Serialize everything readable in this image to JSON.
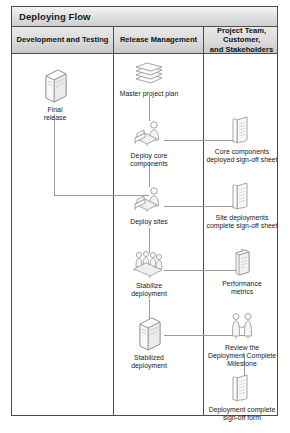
{
  "diagram": {
    "title": "Deploying Flow",
    "type": "cross-functional swimlane flowchart",
    "columns": [
      {
        "id": "development-and-testing",
        "header": "Development and Testing"
      },
      {
        "id": "release-management",
        "header": "Release Management"
      },
      {
        "id": "project-team-customer-and-stakeholders",
        "header": "Project Team, Customer,\nand Stakeholders"
      }
    ],
    "column_headers": {
      "col1": "Development and Testing",
      "col2": "Release Management",
      "col3_line1": "Project Team, Customer,",
      "col3_line2": "and Stakeholders"
    },
    "nodes": {
      "final_release": {
        "line1": "Final",
        "line2": "release",
        "icon": "server-tower-icon",
        "column": 1
      },
      "master_project_plan": {
        "line1": "Master project plan",
        "line2": "",
        "icon": "document-stack-icon",
        "column": 2
      },
      "deploy_core_components": {
        "line1": "Deploy core",
        "line2": "components",
        "icon": "person-at-workstation-icon",
        "column": 2
      },
      "deploy_sites": {
        "line1": "Deploy sites",
        "line2": "",
        "icon": "person-at-workstation-icon",
        "column": 2
      },
      "stabilize_deployment": {
        "line1": "Stabilize",
        "line2": "deployment",
        "icon": "group-of-people-icon",
        "column": 2
      },
      "stabilized_deployment": {
        "line1": "Stabilized",
        "line2": "deployment",
        "icon": "server-tower-icon",
        "column": 2
      },
      "core_components_signoff": {
        "line1": "Core components",
        "line2": "deployed sign-off sheet",
        "icon": "document-icon",
        "column": 3
      },
      "site_deployments_signoff": {
        "line1": "Site deployments",
        "line2": "complete sign-off sheet",
        "icon": "document-icon",
        "column": 3
      },
      "performance_metrics": {
        "line1": "Performance",
        "line2": "metrics",
        "icon": "clipboard-icon",
        "column": 3
      },
      "review_milestone": {
        "line1": "Review the",
        "line2": "Deployment Complete",
        "line3": "Milestone",
        "icon": "two-people-handshake-icon",
        "column": 3
      },
      "deployment_complete_form": {
        "line1": "Deployment complete",
        "line2": "sign-off form",
        "icon": "document-icon",
        "column": 3
      }
    },
    "colors": {
      "border": "#4c4c4c",
      "connector": "#9a9a9a",
      "header_fill": "#dcdcdc",
      "title_fill": "#e2e2e2",
      "icon_stroke": "#8a8a8a",
      "text": "#1a1a1a",
      "page_background": "#ffffff"
    }
  }
}
